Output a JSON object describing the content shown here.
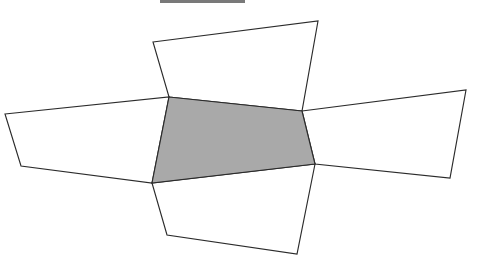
{
  "figure": {
    "canvas": {
      "width": 481,
      "height": 260
    },
    "colors": {
      "background": "#ffffff",
      "stroke": "#2b2b2b",
      "face_white": "#ffffff",
      "face_shaded": "#a9a9a9",
      "rule": "#6e6e6e"
    },
    "stroke_width": 1.15,
    "top_rule": {
      "name": "top-rule-artifact",
      "x": 160,
      "y": 0,
      "width": 85,
      "height": 3
    },
    "faces": [
      {
        "id": "top-flap",
        "label": "Top flap",
        "fill": "white",
        "points": "153,42 318,21 302,111 169,97"
      },
      {
        "id": "left-wing",
        "label": "Left wing flap",
        "fill": "white",
        "points": "5,114 169,97 152,183 21,166"
      },
      {
        "id": "right-wing",
        "label": "Right wing flap",
        "fill": "white",
        "points": "302,111 466,90 450,178 315,164"
      },
      {
        "id": "bottom-flap",
        "label": "Bottom flap",
        "fill": "white",
        "points": "152,183 315,164 297,254 167,235"
      },
      {
        "id": "center-face",
        "label": "Center shaded face",
        "fill": "shaded",
        "points": "169,97 302,111 315,164 152,183"
      }
    ],
    "vertices": [
      {
        "id": "v-top-left",
        "x": 153,
        "y": 42
      },
      {
        "id": "v-top-right",
        "x": 318,
        "y": 21
      },
      {
        "id": "v-center-top-left",
        "x": 169,
        "y": 97
      },
      {
        "id": "v-center-top-right",
        "x": 302,
        "y": 111
      },
      {
        "id": "v-center-bot-right",
        "x": 315,
        "y": 164
      },
      {
        "id": "v-center-bot-left",
        "x": 152,
        "y": 183
      },
      {
        "id": "v-left-outer-top",
        "x": 5,
        "y": 114
      },
      {
        "id": "v-left-outer-bot",
        "x": 21,
        "y": 166
      },
      {
        "id": "v-right-outer-top",
        "x": 466,
        "y": 90
      },
      {
        "id": "v-right-outer-bot",
        "x": 450,
        "y": 178
      },
      {
        "id": "v-bottom-left",
        "x": 167,
        "y": 235
      },
      {
        "id": "v-bottom-right",
        "x": 297,
        "y": 254
      }
    ]
  }
}
